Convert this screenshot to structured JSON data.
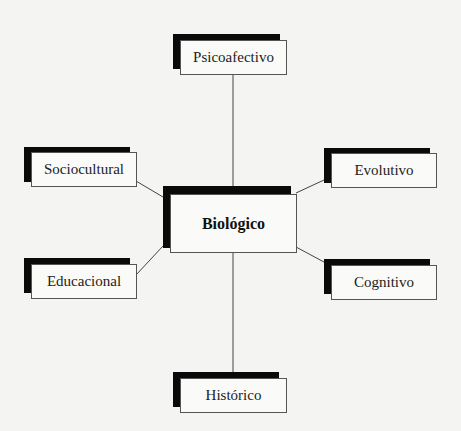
{
  "diagram": {
    "center": {
      "label": "Biológico"
    },
    "nodes": [
      {
        "id": "psicoafectivo",
        "label": "Psicoafectivo"
      },
      {
        "id": "sociocultural",
        "label": "Sociocultural"
      },
      {
        "id": "evolutivo",
        "label": "Evolutivo"
      },
      {
        "id": "educacional",
        "label": "Educacional"
      },
      {
        "id": "cognitivo",
        "label": "Cognitivo"
      },
      {
        "id": "historico",
        "label": "Histórico"
      }
    ],
    "colors": {
      "shadow": "#0a0a0a",
      "box_fill": "#fafaf8",
      "border": "#555555",
      "line": "#444444"
    }
  }
}
